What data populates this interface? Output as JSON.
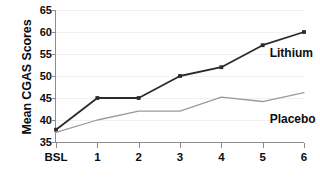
{
  "chart_data": {
    "type": "line",
    "title": "",
    "xlabel": "",
    "ylabel": "Mean CGAS Scores",
    "categories": [
      "BSL",
      "1",
      "2",
      "3",
      "4",
      "5",
      "6"
    ],
    "ylim": [
      35,
      65
    ],
    "yticks": [
      35,
      40,
      45,
      50,
      55,
      60,
      65
    ],
    "grid": true,
    "legend_position": "inline-right",
    "series": [
      {
        "name": "Lithium",
        "color": "#2b2b2b",
        "marker": "square",
        "values": [
          37.8,
          45.0,
          45.0,
          50.0,
          52.0,
          57.0,
          60.0
        ]
      },
      {
        "name": "Placebo",
        "color": "#9a9a9a",
        "marker": "none",
        "values": [
          37.2,
          40.0,
          42.0,
          42.0,
          45.2,
          44.2,
          46.2
        ]
      }
    ],
    "annotations": [
      {
        "text": "Lithium",
        "x_category": "5",
        "y_value": 55.0
      },
      {
        "text": "Placebo",
        "x_category": "5",
        "y_value": 40.0
      }
    ]
  },
  "axis": {
    "y_title": "Mean CGAS Scores"
  }
}
